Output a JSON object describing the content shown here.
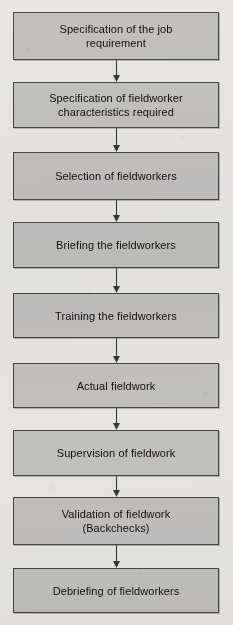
{
  "diagram": {
    "type": "flowchart",
    "orientation": "vertical",
    "node_fill_color": "#c9c9c9",
    "node_border_color": "#4a4a4a",
    "connector_color": "#3a3a3a",
    "background_color": "#f2f1ef",
    "nodes": [
      {
        "id": "node-1",
        "label": "Specification of the job\nrequirement",
        "lines": 2,
        "top": 12,
        "height": 48
      },
      {
        "id": "node-2",
        "label": "Specification  of  fieldworker\ncharacteristics required",
        "lines": 2,
        "top": 82,
        "height": 46
      },
      {
        "id": "node-3",
        "label": "Selection of fieldworkers",
        "lines": 1,
        "top": 152,
        "height": 48
      },
      {
        "id": "node-4",
        "label": "Briefing the fieldworkers",
        "lines": 1,
        "top": 222,
        "height": 46
      },
      {
        "id": "node-5",
        "label": "Training the fieldworkers",
        "lines": 1,
        "top": 293,
        "height": 45
      },
      {
        "id": "node-6",
        "label": "Actual fieldwork",
        "lines": 1,
        "top": 363,
        "height": 45
      },
      {
        "id": "node-7",
        "label": "Supervision of fieldwork",
        "lines": 1,
        "top": 430,
        "height": 46
      },
      {
        "id": "node-8",
        "label": "Validation of fieldwork\n(Backchecks)",
        "lines": 2,
        "top": 497,
        "height": 48
      },
      {
        "id": "node-9",
        "label": "Debriefing of fieldworkers",
        "lines": 1,
        "top": 568,
        "height": 45
      }
    ],
    "connectors": [
      {
        "id": "arrow-1",
        "from": "node-1",
        "to": "node-2",
        "top": 60,
        "height": 22
      },
      {
        "id": "arrow-2",
        "from": "node-2",
        "to": "node-3",
        "top": 128,
        "height": 24
      },
      {
        "id": "arrow-3",
        "from": "node-3",
        "to": "node-4",
        "top": 200,
        "height": 22
      },
      {
        "id": "arrow-4",
        "from": "node-4",
        "to": "node-5",
        "top": 268,
        "height": 25
      },
      {
        "id": "arrow-5",
        "from": "node-5",
        "to": "node-6",
        "top": 338,
        "height": 25
      },
      {
        "id": "arrow-6",
        "from": "node-6",
        "to": "node-7",
        "top": 408,
        "height": 22
      },
      {
        "id": "arrow-7",
        "from": "node-7",
        "to": "node-8",
        "top": 476,
        "height": 21
      },
      {
        "id": "arrow-8",
        "from": "node-8",
        "to": "node-9",
        "top": 545,
        "height": 23
      }
    ]
  }
}
